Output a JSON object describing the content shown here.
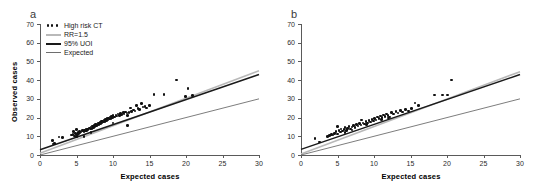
{
  "figure": {
    "panels": [
      {
        "letter": "a",
        "xlabel": "Expected cases",
        "ylabel": "Observed cases",
        "has_legend": true,
        "has_ytitle": true
      },
      {
        "letter": "b",
        "xlabel": "Expected cases",
        "ylabel": "",
        "has_legend": false,
        "has_ytitle": false
      }
    ]
  },
  "legend": {
    "items": [
      {
        "label": "High risk CT",
        "key": "dots-marker",
        "color": "#111111"
      },
      {
        "label": "RR=1.5",
        "key": "line-light",
        "color": "#b9b9b9"
      },
      {
        "label": "95% UOI",
        "key": "line-dark",
        "color": "#1a1a1a"
      },
      {
        "label": "Expected",
        "key": "line-mid",
        "color": "#6e6e6e"
      }
    ]
  },
  "axes": {
    "y_ticks": [
      0,
      10,
      20,
      30,
      40,
      50,
      60,
      70
    ],
    "x_ticks": [
      0,
      5,
      10,
      15,
      20,
      25,
      30
    ],
    "xlim": [
      0,
      30
    ],
    "ylim": [
      0,
      70
    ]
  },
  "chart_data": {
    "type": "scatter",
    "title": "",
    "xlabel": "Expected cases",
    "ylabel": "Observed cases",
    "xlim": [
      0,
      30
    ],
    "ylim": [
      0,
      70
    ],
    "grid": false,
    "legend_position": "top-left",
    "legend_entries": [
      "High risk CT",
      "RR=1.5",
      "95% UOI",
      "Expected"
    ],
    "panels": [
      {
        "letter": "a",
        "series": [
          {
            "name": "High risk CT",
            "type": "scatter",
            "points": [
              [
                1.7,
                7.6
              ],
              [
                1.8,
                5.8
              ],
              [
                2.0,
                6.0
              ],
              [
                2.6,
                9.6
              ],
              [
                3.1,
                9.4
              ],
              [
                4.3,
                10.6
              ],
              [
                4.5,
                11.0
              ],
              [
                4.6,
                12.4
              ],
              [
                4.7,
                10.2
              ],
              [
                4.9,
                11.6
              ],
              [
                5.0,
                13.5
              ],
              [
                5.1,
                11.1
              ],
              [
                5.2,
                12.0
              ],
              [
                5.3,
                11.4
              ],
              [
                5.4,
                12.6
              ],
              [
                5.5,
                11.8
              ],
              [
                5.6,
                12.2
              ],
              [
                5.8,
                13.0
              ],
              [
                6.0,
                12.5
              ],
              [
                6.1,
                13.4
              ],
              [
                6.2,
                12.8
              ],
              [
                6.3,
                13.8
              ],
              [
                6.4,
                13.2
              ],
              [
                6.5,
                14.0
              ],
              [
                6.6,
                13.6
              ],
              [
                6.8,
                14.4
              ],
              [
                6.9,
                13.9
              ],
              [
                7.0,
                15.0
              ],
              [
                7.1,
                14.2
              ],
              [
                7.2,
                15.4
              ],
              [
                7.3,
                14.8
              ],
              [
                7.4,
                15.8
              ],
              [
                7.5,
                15.2
              ],
              [
                7.6,
                16.2
              ],
              [
                7.7,
                15.6
              ],
              [
                7.8,
                16.6
              ],
              [
                7.9,
                16.0
              ],
              [
                8.0,
                17.0
              ],
              [
                8.1,
                16.4
              ],
              [
                8.2,
                17.4
              ],
              [
                8.3,
                16.8
              ],
              [
                8.4,
                17.8
              ],
              [
                8.5,
                17.2
              ],
              [
                8.6,
                18.2
              ],
              [
                8.7,
                17.6
              ],
              [
                8.8,
                18.6
              ],
              [
                8.9,
                18.0
              ],
              [
                9.0,
                19.0
              ],
              [
                9.1,
                18.4
              ],
              [
                9.2,
                19.4
              ],
              [
                9.3,
                18.8
              ],
              [
                9.4,
                19.8
              ],
              [
                9.5,
                19.2
              ],
              [
                9.6,
                20.2
              ],
              [
                9.7,
                19.6
              ],
              [
                9.8,
                20.6
              ],
              [
                9.9,
                20.0
              ],
              [
                10.0,
                21.0
              ],
              [
                10.2,
                20.4
              ],
              [
                10.4,
                21.4
              ],
              [
                10.5,
                20.8
              ],
              [
                10.7,
                21.8
              ],
              [
                10.9,
                21.2
              ],
              [
                11.0,
                22.2
              ],
              [
                11.2,
                21.6
              ],
              [
                11.4,
                22.6
              ],
              [
                11.5,
                22.0
              ],
              [
                11.7,
                23.0
              ],
              [
                11.9,
                22.4
              ],
              [
                12.0,
                21.2
              ],
              [
                12.2,
                22.8
              ],
              [
                12.4,
                25.2
              ],
              [
                12.5,
                23.2
              ],
              [
                12.8,
                24.0
              ],
              [
                13.0,
                23.6
              ],
              [
                13.2,
                26.6
              ],
              [
                13.4,
                25.0
              ],
              [
                13.6,
                24.4
              ],
              [
                13.9,
                27.4
              ],
              [
                14.1,
                25.6
              ],
              [
                14.4,
                26.0
              ],
              [
                14.6,
                25.2
              ],
              [
                15.0,
                26.4
              ],
              [
                15.6,
                32.4
              ],
              [
                17.0,
                32.2
              ],
              [
                18.7,
                40.0
              ],
              [
                20.3,
                35.6
              ],
              [
                19.9,
                31.2
              ],
              [
                20.9,
                31.8
              ],
              [
                12.0,
                15.8
              ],
              [
                6.0,
                10.0
              ],
              [
                7.0,
                12.0
              ],
              [
                5.0,
                10.0
              ],
              [
                10.0,
                17.0
              ]
            ]
          },
          {
            "name": "RR=1.5",
            "type": "line",
            "color": "#b9b9b9",
            "x": [
              0,
              30
            ],
            "y": [
              1.0,
              45.0
            ]
          },
          {
            "name": "95% UOI",
            "type": "line",
            "color": "#1a1a1a",
            "x": [
              0,
              30
            ],
            "y": [
              2.8,
              43.0
            ]
          },
          {
            "name": "Expected",
            "type": "line",
            "color": "#6e6e6e",
            "x": [
              0,
              30
            ],
            "y": [
              0.0,
              30.0
            ]
          }
        ]
      },
      {
        "letter": "b",
        "series": [
          {
            "name": "High risk CT",
            "type": "scatter",
            "points": [
              [
                1.9,
                8.8
              ],
              [
                2.5,
                7.0
              ],
              [
                3.6,
                10.0
              ],
              [
                3.9,
                10.4
              ],
              [
                4.2,
                11.0
              ],
              [
                4.4,
                10.6
              ],
              [
                4.6,
                11.6
              ],
              [
                4.8,
                12.4
              ],
              [
                5.0,
                11.2
              ],
              [
                5.2,
                13.0
              ],
              [
                5.4,
                12.2
              ],
              [
                5.5,
                14.0
              ],
              [
                5.7,
                12.8
              ],
              [
                5.9,
                13.6
              ],
              [
                6.0,
                14.6
              ],
              [
                6.2,
                13.2
              ],
              [
                6.4,
                14.2
              ],
              [
                6.6,
                15.2
              ],
              [
                6.8,
                14.0
              ],
              [
                7.0,
                15.0
              ],
              [
                7.2,
                15.8
              ],
              [
                7.4,
                14.8
              ],
              [
                7.6,
                16.2
              ],
              [
                7.8,
                15.4
              ],
              [
                8.0,
                16.8
              ],
              [
                8.2,
                16.0
              ],
              [
                8.3,
                18.8
              ],
              [
                8.5,
                17.2
              ],
              [
                8.7,
                16.6
              ],
              [
                8.9,
                17.8
              ],
              [
                9.1,
                17.0
              ],
              [
                9.3,
                18.4
              ],
              [
                9.5,
                17.6
              ],
              [
                9.7,
                19.0
              ],
              [
                9.9,
                18.2
              ],
              [
                10.1,
                19.6
              ],
              [
                10.3,
                18.8
              ],
              [
                10.5,
                20.2
              ],
              [
                10.7,
                19.4
              ],
              [
                10.9,
                20.8
              ],
              [
                11.1,
                20.0
              ],
              [
                11.3,
                21.4
              ],
              [
                11.5,
                20.6
              ],
              [
                11.7,
                22.0
              ],
              [
                11.9,
                21.2
              ],
              [
                12.1,
                20.4
              ],
              [
                12.4,
                22.6
              ],
              [
                12.7,
                21.8
              ],
              [
                13.0,
                23.2
              ],
              [
                13.3,
                22.4
              ],
              [
                13.6,
                23.8
              ],
              [
                13.9,
                23.0
              ],
              [
                14.3,
                24.4
              ],
              [
                14.7,
                23.6
              ],
              [
                15.1,
                25.0
              ],
              [
                15.6,
                27.8
              ],
              [
                16.1,
                26.6
              ],
              [
                18.3,
                32.0
              ],
              [
                19.4,
                32.0
              ],
              [
                20.1,
                32.0
              ],
              [
                20.6,
                40.0
              ],
              [
                5.0,
                15.2
              ],
              [
                6.0,
                12.0
              ],
              [
                7.0,
                13.4
              ],
              [
                9.0,
                16.2
              ],
              [
                11.0,
                19.0
              ],
              [
                12.0,
                19.8
              ]
            ]
          },
          {
            "name": "RR=1.5",
            "type": "line",
            "color": "#b9b9b9",
            "x": [
              0,
              30
            ],
            "y": [
              0.6,
              44.5
            ]
          },
          {
            "name": "95% UOI",
            "type": "line",
            "color": "#1a1a1a",
            "x": [
              0,
              30
            ],
            "y": [
              3.0,
              43.0
            ]
          },
          {
            "name": "Expected",
            "type": "line",
            "color": "#6e6e6e",
            "x": [
              0,
              30
            ],
            "y": [
              0.0,
              30.0
            ]
          }
        ]
      }
    ]
  }
}
